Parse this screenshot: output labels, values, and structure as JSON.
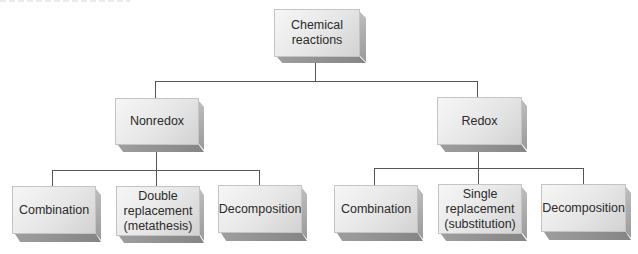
{
  "diagram": {
    "type": "hierarchy",
    "root": {
      "label": "Chemical reactions"
    },
    "categories": [
      {
        "label": "Nonredox",
        "children": [
          {
            "label": "Combination"
          },
          {
            "label": "Double\nreplacement\n(metathesis)"
          },
          {
            "label": "Decomposition"
          }
        ]
      },
      {
        "label": "Redox",
        "children": [
          {
            "label": "Combination"
          },
          {
            "label": "Single\nreplacement\n(substitution)"
          },
          {
            "label": "Decomposition"
          }
        ]
      }
    ]
  },
  "colors": {
    "line": "#555555",
    "box_face_light": "#f6f6f6",
    "box_face_dark": "#d2d2d2",
    "box_side": "#a8a8a8",
    "text": "#2b2b2b"
  }
}
